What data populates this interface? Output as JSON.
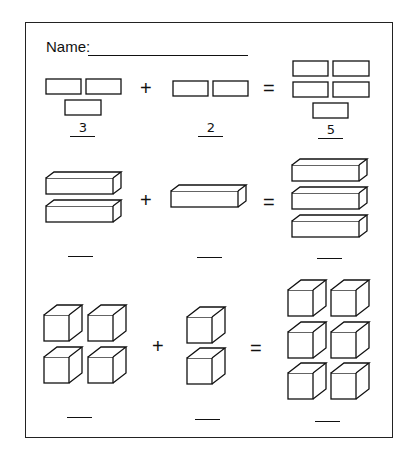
{
  "worksheet": {
    "name_label": "Name:",
    "problems": [
      {
        "type": "flats",
        "left_count": 3,
        "operator": "+",
        "right_count": 2,
        "equals": "=",
        "sum_count": 5,
        "answers": [
          "3",
          "2",
          "5"
        ]
      },
      {
        "type": "rods",
        "left_count": 2,
        "operator": "+",
        "right_count": 1,
        "equals": "=",
        "sum_count": 3,
        "answers": [
          "",
          "",
          ""
        ]
      },
      {
        "type": "cubes",
        "left_count": 4,
        "operator": "+",
        "right_count": 2,
        "equals": "=",
        "sum_count": 6,
        "answers": [
          "",
          "",
          ""
        ]
      }
    ]
  },
  "colors": {
    "ink": "#111111",
    "paper": "#ffffff"
  }
}
